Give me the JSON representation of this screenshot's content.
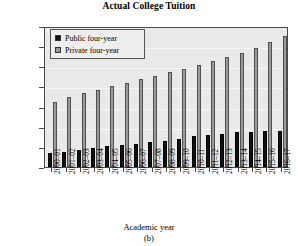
{
  "chart_data": {
    "type": "bar",
    "title": "Actual College Tuition",
    "caption": "(b)",
    "xlabel": "Academic year",
    "ylabel": "",
    "ylim": [
      0,
      35000
    ],
    "ytick_step": 5000,
    "grid": true,
    "legend_position": "top-left",
    "categories": [
      "2000–01",
      "2001–02",
      "2002–03",
      "2003–04",
      "2004–05",
      "2005–06",
      "2006–07",
      "2007–08",
      "2008–09",
      "2009–10",
      "2010–11",
      "2011–12",
      "2012–13",
      "2013–14",
      "2014–15",
      "2015–16",
      "2016–17"
    ],
    "ytick_labels": [
      "$35,000",
      "$30,000",
      "$25,000",
      "$20,000",
      "$15,000",
      "$10,000",
      "$5,000",
      "0"
    ],
    "ytick_values": [
      35000,
      30000,
      25000,
      20000,
      15000,
      10000,
      5000,
      0
    ],
    "series": [
      {
        "name": "Public four-year",
        "color": "#111111",
        "values": [
          3500,
          3800,
          4100,
          4600,
          5100,
          5500,
          5800,
          6200,
          6500,
          7000,
          7600,
          8000,
          8300,
          8600,
          8800,
          8900,
          9000
        ]
      },
      {
        "name": "Private four-year",
        "color": "#9a9a9a",
        "values": [
          16200,
          17400,
          18300,
          19200,
          20100,
          20900,
          21800,
          22700,
          23600,
          24400,
          25300,
          26300,
          27300,
          28400,
          29600,
          31000,
          32400
        ]
      }
    ]
  },
  "legend": {
    "items": [
      {
        "label": "Public four-year",
        "swatch": "public"
      },
      {
        "label": "Private four-year",
        "swatch": "private"
      }
    ]
  }
}
